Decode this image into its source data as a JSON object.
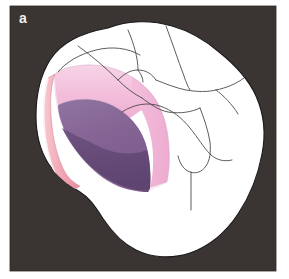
{
  "figure": {
    "panel_label": "a",
    "caption_text": "",
    "view": "occluso-proximal-three-quarter-view"
  },
  "colors": {
    "background_panel": "#3a3433",
    "page_background": "#ffffff",
    "tooth_enamel_fill": "#ffffff",
    "tooth_outline": "#111111",
    "anatomy_line": "#4a4a4a",
    "cavity_enamel_pink": "#f2b9d6",
    "cavity_enamel_pink_light": "#f7d3e6",
    "cavity_dentin_purple": "#8a6b9a",
    "cavity_dentin_purple_dark": "#6b4f7d",
    "cavity_rim_salmon": "#f0a8b4",
    "cavity_rim_salmon_dark": "#e08b9c",
    "label_text": "#f2efec"
  },
  "panel": {
    "x": 10,
    "y": 6,
    "width": 266,
    "height": 265
  },
  "regions": [
    {
      "name": "occlusal-surface",
      "label": "Occlusal surface with cusps and fissures"
    },
    {
      "name": "cavity-preparation",
      "label": "Proximal box cavity preparation"
    },
    {
      "name": "enamel-layer",
      "label": "Enamel layer (pink)"
    },
    {
      "name": "dentin-layer",
      "label": "Dentin layer (purple)"
    },
    {
      "name": "axial-wall",
      "label": "Axial wall of preparation"
    }
  ]
}
